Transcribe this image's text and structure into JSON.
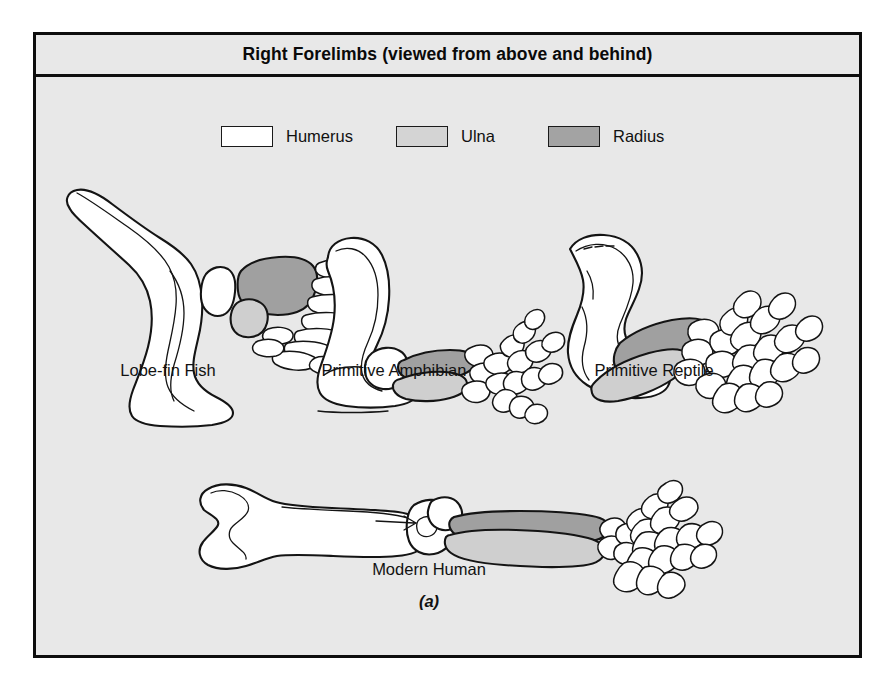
{
  "figure": {
    "title": "Right Forelimbs (viewed from above and behind)",
    "caption": "(a)",
    "background_color": "#e8e8e8",
    "frame_color": "#0d0d0d"
  },
  "legend": {
    "items": [
      {
        "label": "Humerus",
        "color": "#ffffff",
        "swatch_name": "humerus-swatch"
      },
      {
        "label": "Ulna",
        "color": "#d4d4d4",
        "swatch_name": "ulna-swatch"
      },
      {
        "label": "Radius",
        "color": "#a3a3a3",
        "swatch_name": "radius-swatch"
      }
    ]
  },
  "specimens": [
    {
      "id": "lobe-fin-fish",
      "label": "Lobe-fin Fish",
      "digit_count": 0,
      "note": "many unjointed fin ray elements"
    },
    {
      "id": "primitive-amphibian",
      "label": "Primitive Amphibian",
      "digit_count": 4,
      "note": "four digits"
    },
    {
      "id": "primitive-reptile",
      "label": "Primitive Reptile",
      "digit_count": 5,
      "note": "five digits"
    },
    {
      "id": "modern-human",
      "label": "Modern Human",
      "digit_count": 5,
      "note": "five digits"
    }
  ]
}
